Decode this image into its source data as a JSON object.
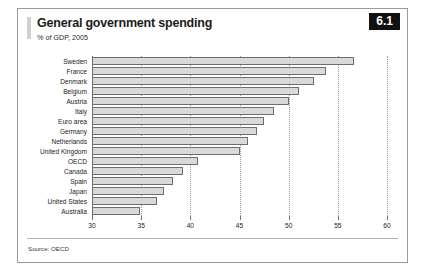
{
  "figure": {
    "title": "General government spending",
    "subtitle": "% of GDP, 2005",
    "badge": "6.1",
    "source": "Source: OECD"
  },
  "chart_data": {
    "type": "bar",
    "orientation": "horizontal",
    "title": "General government spending",
    "subtitle": "% of GDP, 2005",
    "xlabel": "",
    "ylabel": "",
    "xlim": [
      30,
      60
    ],
    "xticks": [
      30,
      35,
      40,
      45,
      50,
      55,
      60
    ],
    "xtick_labels": [
      "30",
      "35",
      "40",
      "45",
      "50",
      "55",
      "60"
    ],
    "grid": true,
    "legend": "none",
    "bar_color": "#d9d9d9",
    "bar_edge_color": "#6d6d6d",
    "categories": [
      "Sweden",
      "France",
      "Denmark",
      "Belgium",
      "Austria",
      "Italy",
      "Euro area",
      "Germany",
      "Netherlands",
      "United Kingdom",
      "OECD",
      "Canada",
      "Spain",
      "Japan",
      "United States",
      "Australia"
    ],
    "values": [
      56.6,
      53.8,
      52.6,
      51.0,
      50.0,
      48.5,
      47.5,
      46.8,
      45.9,
      45.0,
      40.8,
      39.3,
      38.2,
      37.3,
      36.6,
      34.9
    ],
    "source": "Source: OECD"
  }
}
